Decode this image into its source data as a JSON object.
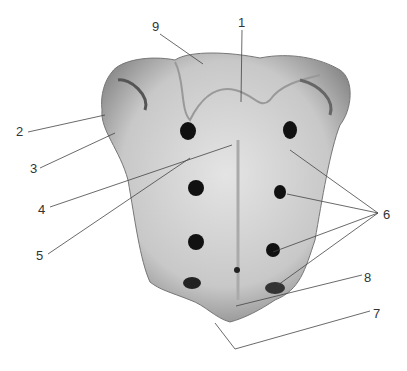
{
  "caption": "",
  "figure": {
    "labels": [
      {
        "id": "1",
        "text": "1",
        "x": 238,
        "y": 16
      },
      {
        "id": "2",
        "text": "2",
        "x": 16,
        "y": 125
      },
      {
        "id": "3",
        "text": "3",
        "x": 30,
        "y": 162
      },
      {
        "id": "4",
        "text": "4",
        "x": 38,
        "y": 203
      },
      {
        "id": "5",
        "text": "5",
        "x": 36,
        "y": 249
      },
      {
        "id": "6",
        "text": "6",
        "x": 383,
        "y": 208
      },
      {
        "id": "7",
        "text": "7",
        "x": 373,
        "y": 307
      },
      {
        "id": "8",
        "text": "8",
        "x": 364,
        "y": 271
      },
      {
        "id": "9",
        "text": "9",
        "x": 152,
        "y": 20
      }
    ]
  }
}
